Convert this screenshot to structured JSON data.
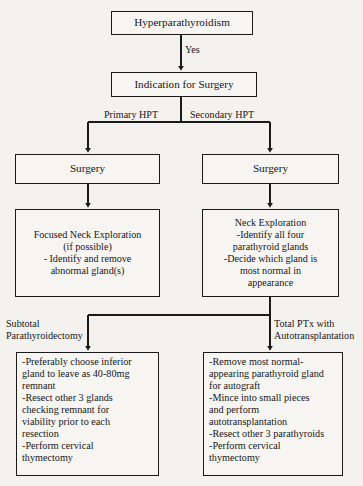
{
  "figure": {
    "type": "flowchart",
    "orientation": "top-down",
    "background_color": "#f3f2ef",
    "line_color": "#1a1a1a",
    "text_color": "#16161a"
  },
  "nodes": {
    "hyperparathyroidism": {
      "label": "Hyperparathyroidism"
    },
    "indication_for_surgery": {
      "label": "Indication for Surgery"
    },
    "surgery_left": {
      "label": "Surgery"
    },
    "surgery_right": {
      "label": "Surgery"
    },
    "focused_neck_exploration": {
      "label": "Focused Neck Exploration\n(if possible)\n- Identify and remove\nabnormal gland(s)"
    },
    "neck_exploration": {
      "label": "Neck Exploration\n-Identify all four\nparathyroid glands\n-Decide which gland is\nmost normal in\nappearance"
    },
    "subtotal_parathyroidectomy_steps": {
      "label": "-Preferably choose inferior\ngland to leave as 40-80mg\nremnant\n-Resect other 3 glands\nchecking remnant for\nviability prior to each\nresection\n-Perform cervical\nthymectomy"
    },
    "total_ptx_autotransplantation_steps": {
      "label": "-Remove most normal-\nappearing parathyroid gland\nfor autograft\n-Mince into small pieces\nand perform\nautotransplantation\n-Resect other 3 parathyroids\n-Perform cervical\nthymectomy"
    }
  },
  "edge_labels": {
    "yes": "Yes",
    "primary_hpt": "Primary HPT",
    "secondary_hpt": "Secondary HPT",
    "subtotal_parathyroidectomy": "Subtotal\nParathyroidectomy",
    "total_ptx_with_autotransplantation": "Total PTx with\nAutotransplantation"
  }
}
